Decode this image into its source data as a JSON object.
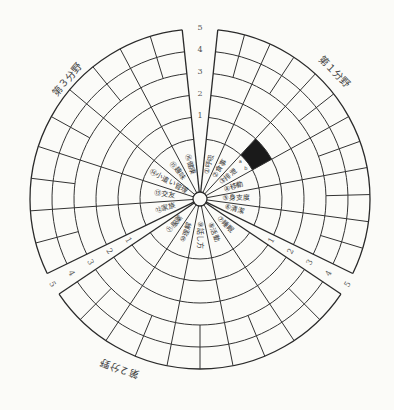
{
  "chart_data": {
    "type": "radial_grid",
    "title": "",
    "center": [
      200,
      199
    ],
    "levels": [
      "1",
      "2",
      "3",
      "4",
      "5"
    ],
    "sections": [
      {
        "name": "第1分野",
        "items": [
          "①呼吸",
          "②食事",
          "③排泄",
          "④移動",
          "⑤身支度",
          "⑥清潔"
        ]
      },
      {
        "name": "第2分野",
        "items": [
          "⑦睡眠",
          "⑧活動",
          "⑨話し方",
          "⑩理解",
          "⑪服薬"
        ]
      },
      {
        "name": "第3分野",
        "items": [
          "⑫家族",
          "⑬交友",
          "⑭小遣い管理",
          "⑮趣味",
          "⑯健康"
        ]
      }
    ],
    "filled_cells": [
      {
        "section": "第1分野",
        "item": "③排泄",
        "level": "1",
        "color": "#1a1a1a"
      }
    ],
    "sub_labels": [
      "a",
      "b",
      "c"
    ]
  },
  "scale_ticks": {
    "top": [
      "1",
      "2",
      "3",
      "4",
      "5"
    ],
    "right": [
      "1",
      "2",
      "3",
      "4",
      "5"
    ],
    "left": [
      "1",
      "2",
      "3",
      "4",
      "5"
    ]
  },
  "section_titles": {
    "s1": "第１分野",
    "s2": "第２分野",
    "s3": "第３分野"
  },
  "colors": {
    "line": "#333333",
    "fill": "#1a1a1a",
    "background": "#fbfbf8"
  }
}
